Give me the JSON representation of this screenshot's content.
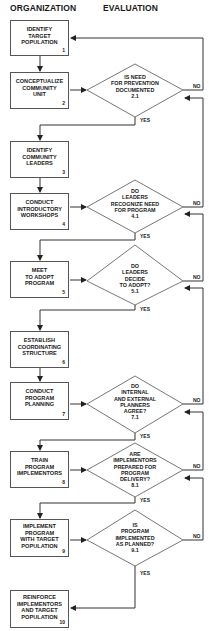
{
  "headers": {
    "left": "ORGANIZATION",
    "right": "EVALUATION"
  },
  "steps": [
    {
      "id": "1",
      "label": "IDENTIFY\nTARGET\nPOPULATION",
      "number": "1"
    },
    {
      "id": "2",
      "label": "CONCEPTUALIZE\nCOMMUNITY\nUNIT",
      "number": "2"
    },
    {
      "id": "3",
      "label": "IDENTIFY\nCOMMUNITY\nLEADERS",
      "number": "3"
    },
    {
      "id": "4",
      "label": "CONDUCT\nINTRODUCTORY\nWORKSHOPS",
      "number": "4"
    },
    {
      "id": "5",
      "label": "MEET\nTO ADOPT\nPROGRAM",
      "number": "5"
    },
    {
      "id": "6",
      "label": "ESTABLISH\nCOORDINATING\nSTRUCTURE",
      "number": "6"
    },
    {
      "id": "7",
      "label": "CONDUCT\nPROGRAM\nPLANNING",
      "number": "7"
    },
    {
      "id": "8",
      "label": "TRAIN\nPROGRAM\nIMPLEMENTORS",
      "number": "8"
    },
    {
      "id": "9",
      "label": "IMPLEMENT\nPROGRAM\nWITH TARGET\nPOPULATION",
      "number": "9"
    },
    {
      "id": "10",
      "label": "REINFORCE\nIMPLEMENTORS\nAND TARGET\nPOPULATION",
      "number": "10"
    }
  ],
  "decisions": [
    {
      "id": "2.1",
      "label": "IS NEED\nFOR PREVENTION\nDOCUMENTED\n2.1"
    },
    {
      "id": "4.1",
      "label": "DO\nLEADERS\nRECOGNIZE NEED\nFOR PROGRAM\n4.1"
    },
    {
      "id": "5.1",
      "label": "DO\nLEADERS\nDECIDE\nTO ADOPT?\n5.1"
    },
    {
      "id": "7.1",
      "label": "DO\nINTERNAL\nAND EXTERNAL\nPLANNERS\nAGREE?\n7.1"
    },
    {
      "id": "8.1",
      "label": "ARE\nIMPLEMENTORS\nPREPARED FOR\nPROGRAM\nDELIVERY?\n8.1"
    },
    {
      "id": "9.1",
      "label": "IS\nPROGRAM\nIMPLEMENTED\nAS PLANNED?\n9.1"
    }
  ],
  "edge_labels": {
    "yes": "YES",
    "no": "NO"
  }
}
